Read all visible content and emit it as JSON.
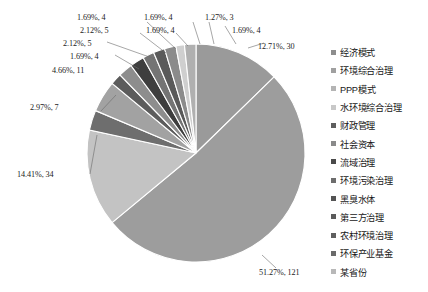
{
  "chart_data": {
    "type": "pie",
    "title": "",
    "subtitle": "",
    "xlabel": "",
    "ylabel": "",
    "grid": false,
    "legend_position": "right",
    "start_angle_deg": 0,
    "direction": "clockwise",
    "total": 236,
    "categories": [
      "经济模式",
      "环境综合治理",
      "PPP模式",
      "水环境综合治理",
      "财政管理",
      "社会资本",
      "流域治理",
      "环境污染治理",
      "黑臭水体",
      "第三方治理",
      "农村环境治理",
      "环保产业基金",
      "某省份"
    ],
    "values": [
      30,
      121,
      34,
      7,
      11,
      4,
      5,
      5,
      4,
      4,
      4,
      3,
      4
    ],
    "percents": [
      12.71,
      51.27,
      14.41,
      2.97,
      4.66,
      1.69,
      2.12,
      2.12,
      1.69,
      1.69,
      1.69,
      1.27,
      1.69
    ],
    "data_labels": [
      "12.71%, 30",
      "51.27%, 121",
      "14.41%, 34",
      "2.97%, 7",
      "4.66%, 11",
      "1.69%, 4",
      "2.12%, 5",
      "2.12%, 5",
      "1.69%, 4",
      "1.69%, 4",
      "1.69%, 4",
      "1.27%, 3",
      "1.69%, 4"
    ],
    "colors": [
      "#9a9a9a",
      "#9d9d9d",
      "#c3c3c3",
      "#6e6e6e",
      "#a2a2a2",
      "#5c5c5c",
      "#8d8d8d",
      "#3e3e3e",
      "#747474",
      "#5a5a5a",
      "#8b8b8b",
      "#cfcfcf",
      "#b0b0b0"
    ]
  },
  "legend": {
    "items": [
      {
        "label": "经济模式",
        "color": "#8d8d8d"
      },
      {
        "label": "环境综合治理",
        "color": "#a0a0a0"
      },
      {
        "label": "PPP模式",
        "color": "#b4b4b4"
      },
      {
        "label": "水环境综合治理",
        "color": "#c8c8c8"
      },
      {
        "label": "财政管理",
        "color": "#5e5e5e"
      },
      {
        "label": "社会资本",
        "color": "#8a8a8a"
      },
      {
        "label": "流域治理",
        "color": "#4a4a4a"
      },
      {
        "label": "环境污染治理",
        "color": "#6d6d6d"
      },
      {
        "label": "黑臭水体",
        "color": "#545454"
      },
      {
        "label": "第三方治理",
        "color": "#5b5b5b"
      },
      {
        "label": "农村环境治理",
        "color": "#5f5f5f"
      },
      {
        "label": "环保产业基金",
        "color": "#6a6a6a"
      },
      {
        "label": "某省份",
        "color": "#b8b8b8"
      }
    ]
  },
  "labels": {
    "top_1": "1.69%, 4",
    "top_2": "1.69%, 4",
    "top_3": "1.27%, 3",
    "top_4": "1.69%, 4",
    "top_5": "2.12%, 5",
    "top_6": "1.69%, 4",
    "left_1": "2.12%, 5",
    "left_2": "1.69%, 4",
    "left_3": "4.66%, 11",
    "left_4": "2.97%, 7",
    "left_5": "14.41%, 34",
    "right_1": "12.71%, 30",
    "bottom_1": "51.27%, 121"
  }
}
